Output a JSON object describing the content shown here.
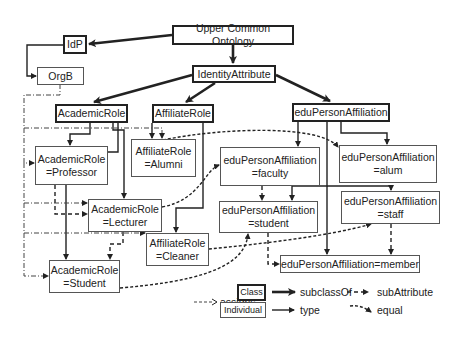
{
  "diagram": {
    "nodes": {
      "uco": "Upper Common Ontology",
      "idp": "IdP",
      "orgb": "OrgB",
      "identity": "IdentityAttribute",
      "academic": "AcademicRole",
      "affiliate": "AffiliateRole",
      "edu": "eduPersonAffiliation",
      "professor": [
        "AcademicRole",
        "=Professor"
      ],
      "alumni": [
        "AffiliateRole",
        "=Alumni"
      ],
      "faculty": [
        "eduPersonAffiliation",
        "=faculty"
      ],
      "alum": [
        "eduPersonAffiliation",
        "=alum"
      ],
      "lecturer": [
        "AcademicRole",
        "=Lecturer"
      ],
      "cleaner": [
        "AffiliateRole",
        "=Cleaner"
      ],
      "student_edu": [
        "eduPersonAffiliation",
        "=student"
      ],
      "staff": [
        "eduPersonAffiliation",
        "=staff"
      ],
      "student_ac": [
        "AcademicRole",
        "=Student"
      ],
      "member": "eduPersonAffiliation=member"
    },
    "legend": {
      "assigns": "assigns",
      "class_label": "Class",
      "individual_label": "Individual",
      "subclassOf": "subclassOf",
      "subAttribute": "subAttribute",
      "type": "type",
      "equal": "equal"
    },
    "colors": {
      "line": "#222222",
      "border": "#444444",
      "background": "#ffffff"
    }
  }
}
